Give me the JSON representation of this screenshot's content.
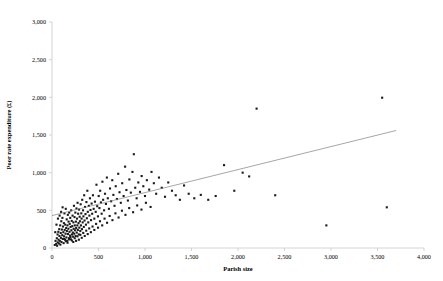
{
  "chart_data": {
    "type": "scatter",
    "title": "",
    "xlabel": "Parish size",
    "ylabel": "Poor rate expenditure (£)",
    "xlim": [
      0,
      4000
    ],
    "ylim": [
      0,
      3000
    ],
    "xticks": [
      0,
      500,
      1000,
      1500,
      2000,
      2500,
      3000,
      3500,
      4000
    ],
    "yticks": [
      0,
      500,
      1000,
      1500,
      2000,
      2500,
      3000
    ],
    "xticklabels": [
      "0",
      "500",
      "1,000",
      "1,500",
      "2,000",
      "2,500",
      "3,000",
      "3,500",
      "4,000"
    ],
    "yticklabels": [
      "0",
      "500",
      "1,000",
      "1,500",
      "2,000",
      "2,500",
      "3,000"
    ],
    "grid": false,
    "legend": null,
    "marker_color": "#1a1a1a",
    "marker_shape": "square",
    "marker_size": 2.1,
    "trendline": {
      "type": "linear",
      "color": "#808080",
      "x": [
        0,
        3700
      ],
      "y": [
        430,
        1560
      ]
    },
    "points": [
      [
        30,
        40
      ],
      [
        38,
        95
      ],
      [
        45,
        55
      ],
      [
        52,
        130
      ],
      [
        55,
        30
      ],
      [
        60,
        180
      ],
      [
        62,
        75
      ],
      [
        68,
        215
      ],
      [
        70,
        110
      ],
      [
        74,
        60
      ],
      [
        78,
        250
      ],
      [
        80,
        160
      ],
      [
        84,
        95
      ],
      [
        88,
        300
      ],
      [
        90,
        45
      ],
      [
        94,
        200
      ],
      [
        96,
        135
      ],
      [
        100,
        355
      ],
      [
        102,
        80
      ],
      [
        106,
        245
      ],
      [
        110,
        170
      ],
      [
        112,
        400
      ],
      [
        116,
        120
      ],
      [
        118,
        285
      ],
      [
        122,
        210
      ],
      [
        125,
        65
      ],
      [
        128,
        330
      ],
      [
        130,
        155
      ],
      [
        134,
        460
      ],
      [
        136,
        240
      ],
      [
        140,
        110
      ],
      [
        142,
        310
      ],
      [
        146,
        190
      ],
      [
        148,
        520
      ],
      [
        152,
        265
      ],
      [
        155,
        140
      ],
      [
        158,
        380
      ],
      [
        160,
        225
      ],
      [
        164,
        95
      ],
      [
        166,
        300
      ],
      [
        170,
        440
      ],
      [
        172,
        185
      ],
      [
        176,
        255
      ],
      [
        178,
        350
      ],
      [
        182,
        130
      ],
      [
        185,
        470
      ],
      [
        188,
        215
      ],
      [
        190,
        320
      ],
      [
        194,
        165
      ],
      [
        196,
        400
      ],
      [
        200,
        280
      ],
      [
        203,
        115
      ],
      [
        206,
        500
      ],
      [
        208,
        235
      ],
      [
        212,
        360
      ],
      [
        215,
        180
      ],
      [
        218,
        290
      ],
      [
        221,
        430
      ],
      [
        224,
        205
      ],
      [
        227,
        150
      ],
      [
        230,
        340
      ],
      [
        233,
        255
      ],
      [
        236,
        560
      ],
      [
        239,
        190
      ],
      [
        242,
        410
      ],
      [
        245,
        300
      ],
      [
        248,
        235
      ],
      [
        251,
        470
      ],
      [
        254,
        160
      ],
      [
        257,
        350
      ],
      [
        260,
        265
      ],
      [
        263,
        525
      ],
      [
        266,
        205
      ],
      [
        269,
        390
      ],
      [
        272,
        300
      ],
      [
        275,
        600
      ],
      [
        278,
        240
      ],
      [
        281,
        455
      ],
      [
        285,
        330
      ],
      [
        288,
        180
      ],
      [
        291,
        510
      ],
      [
        294,
        270
      ],
      [
        297,
        415
      ],
      [
        300,
        355
      ],
      [
        304,
        225
      ],
      [
        308,
        580
      ],
      [
        311,
        300
      ],
      [
        315,
        460
      ],
      [
        318,
        390
      ],
      [
        322,
        250
      ],
      [
        325,
        640
      ],
      [
        330,
        340
      ],
      [
        334,
        500
      ],
      [
        338,
        420
      ],
      [
        342,
        280
      ],
      [
        346,
        700
      ],
      [
        350,
        365
      ],
      [
        355,
        545
      ],
      [
        360,
        450
      ],
      [
        365,
        310
      ],
      [
        370,
        610
      ],
      [
        375,
        395
      ],
      [
        380,
        760
      ],
      [
        385,
        480
      ],
      [
        390,
        340
      ],
      [
        396,
        560
      ],
      [
        402,
        430
      ],
      [
        408,
        660
      ],
      [
        414,
        505
      ],
      [
        420,
        370
      ],
      [
        426,
        590
      ],
      [
        432,
        455
      ],
      [
        440,
        700
      ],
      [
        448,
        520
      ],
      [
        455,
        390
      ],
      [
        462,
        615
      ],
      [
        470,
        480
      ],
      [
        478,
        840
      ],
      [
        486,
        555
      ],
      [
        494,
        420
      ],
      [
        502,
        690
      ],
      [
        510,
        530
      ],
      [
        518,
        760
      ],
      [
        526,
        605
      ],
      [
        534,
        455
      ],
      [
        542,
        880
      ],
      [
        550,
        640
      ],
      [
        560,
        500
      ],
      [
        570,
        720
      ],
      [
        580,
        585
      ],
      [
        590,
        935
      ],
      [
        600,
        660
      ],
      [
        612,
        520
      ],
      [
        624,
        790
      ],
      [
        636,
        620
      ],
      [
        648,
        900
      ],
      [
        660,
        705
      ],
      [
        672,
        560
      ],
      [
        685,
        820
      ],
      [
        698,
        650
      ],
      [
        712,
        985
      ],
      [
        726,
        740
      ],
      [
        740,
        600
      ],
      [
        755,
        860
      ],
      [
        770,
        690
      ],
      [
        786,
        1080
      ],
      [
        800,
        770
      ],
      [
        816,
        630
      ],
      [
        832,
        910
      ],
      [
        848,
        735
      ],
      [
        865,
        1010
      ],
      [
        880,
        1245
      ],
      [
        895,
        800
      ],
      [
        910,
        660
      ],
      [
        928,
        870
      ],
      [
        946,
        745
      ],
      [
        964,
        955
      ],
      [
        982,
        820
      ],
      [
        1000,
        690
      ],
      [
        1020,
        900
      ],
      [
        1045,
        775
      ],
      [
        1070,
        1010
      ],
      [
        1095,
        860
      ],
      [
        1120,
        720
      ],
      [
        1150,
        935
      ],
      [
        1180,
        800
      ],
      [
        1215,
        680
      ],
      [
        1250,
        870
      ],
      [
        1290,
        760
      ],
      [
        1330,
        700
      ],
      [
        1375,
        640
      ],
      [
        1420,
        830
      ],
      [
        1470,
        720
      ],
      [
        1530,
        660
      ],
      [
        1600,
        705
      ],
      [
        1680,
        640
      ],
      [
        1760,
        690
      ],
      [
        1850,
        1100
      ],
      [
        1960,
        760
      ],
      [
        2050,
        1000
      ],
      [
        2120,
        950
      ],
      [
        2200,
        1850
      ],
      [
        2400,
        700
      ],
      [
        2950,
        300
      ],
      [
        3550,
        1995
      ],
      [
        3600,
        540
      ],
      [
        35,
        210
      ],
      [
        48,
        310
      ],
      [
        64,
        390
      ],
      [
        82,
        430
      ],
      [
        98,
        480
      ],
      [
        114,
        540
      ],
      [
        131,
        120
      ],
      [
        149,
        90
      ],
      [
        167,
        70
      ],
      [
        184,
        115
      ],
      [
        199,
        145
      ],
      [
        214,
        100
      ],
      [
        229,
        80
      ],
      [
        244,
        130
      ],
      [
        259,
        95
      ],
      [
        274,
        155
      ],
      [
        289,
        110
      ],
      [
        305,
        175
      ],
      [
        320,
        135
      ],
      [
        336,
        200
      ],
      [
        352,
        160
      ],
      [
        368,
        230
      ],
      [
        384,
        185
      ],
      [
        400,
        260
      ],
      [
        418,
        210
      ],
      [
        436,
        285
      ],
      [
        455,
        240
      ],
      [
        474,
        320
      ],
      [
        495,
        270
      ],
      [
        516,
        355
      ],
      [
        540,
        300
      ],
      [
        565,
        390
      ],
      [
        592,
        335
      ],
      [
        620,
        425
      ],
      [
        650,
        370
      ],
      [
        682,
        460
      ],
      [
        716,
        405
      ],
      [
        752,
        495
      ],
      [
        790,
        440
      ],
      [
        830,
        530
      ],
      [
        872,
        475
      ],
      [
        916,
        565
      ],
      [
        962,
        510
      ],
      [
        1010,
        600
      ],
      [
        1060,
        545
      ]
    ]
  }
}
